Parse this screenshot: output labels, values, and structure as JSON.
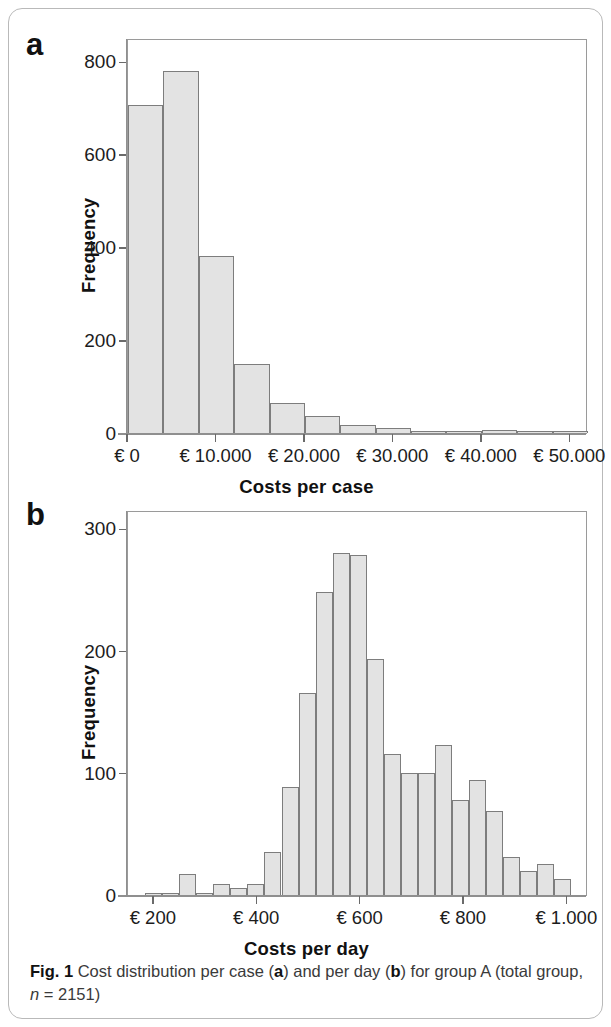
{
  "figure": {
    "caption_prefix": "Fig. 1",
    "caption_part1": " Cost distribution per case (",
    "caption_a": "a",
    "caption_part2": ") and per day (",
    "caption_b": "b",
    "caption_part3": ") for group A (total group, ",
    "caption_n_symbol": "n",
    "caption_n_value": " = 2151)",
    "colors": {
      "bar_fill": "#e3e3e3",
      "bar_stroke": "#7d7d7d",
      "axis": "#8f8f8f",
      "text": "#1c1c1c",
      "frame": "#b9b9b9"
    }
  },
  "panel_a": {
    "letter": "a",
    "chart_data": {
      "type": "bar",
      "title": "",
      "subtitle": "",
      "xlabel": "Costs per case",
      "ylabel": "Frequency",
      "xlim": [
        0,
        52000
      ],
      "ylim": [
        0,
        850
      ],
      "grid": false,
      "legend": null,
      "bin_width": 4000,
      "xtick_values": [
        0,
        10000,
        20000,
        30000,
        40000,
        50000
      ],
      "xtick_labels": [
        "€ 0",
        "€ 10.000",
        "€ 20.000",
        "€ 30.000",
        "€ 40.000",
        "€ 50.000"
      ],
      "ytick_values": [
        0,
        200,
        400,
        600,
        800
      ],
      "ytick_labels": [
        "0",
        "200",
        "400",
        "600",
        "800"
      ],
      "bin_starts": [
        0,
        4000,
        8000,
        12000,
        16000,
        20000,
        24000,
        28000,
        32000,
        36000,
        40000,
        44000,
        48000
      ],
      "values": [
        706,
        778,
        381,
        148,
        64,
        36,
        17,
        10,
        5,
        4,
        7,
        3,
        2
      ]
    }
  },
  "panel_b": {
    "letter": "b",
    "chart_data": {
      "type": "bar",
      "title": "",
      "subtitle": "",
      "xlabel": "Costs per day",
      "ylabel": "Frequency",
      "xlim": [
        150,
        1040
      ],
      "ylim": [
        0,
        315
      ],
      "grid": false,
      "legend": null,
      "bin_width": 33,
      "xtick_values": [
        200,
        400,
        600,
        800,
        1000
      ],
      "xtick_labels": [
        "€ 200",
        "€ 400",
        "€ 600",
        "€ 800",
        "€ 1.000"
      ],
      "ytick_values": [
        0,
        100,
        200,
        300
      ],
      "ytick_labels": [
        "0",
        "100",
        "200",
        "300"
      ],
      "bin_starts": [
        183,
        216,
        249,
        282,
        315,
        348,
        381,
        414,
        447,
        480,
        513,
        546,
        579,
        612,
        645,
        678,
        711,
        744,
        777,
        810,
        843,
        876,
        909,
        942,
        975
      ],
      "values": [
        2,
        1,
        17,
        2,
        9,
        6,
        9,
        35,
        88,
        165,
        248,
        280,
        278,
        193,
        115,
        100,
        100,
        123,
        78,
        94,
        69,
        31,
        20,
        25,
        13
      ]
    }
  }
}
